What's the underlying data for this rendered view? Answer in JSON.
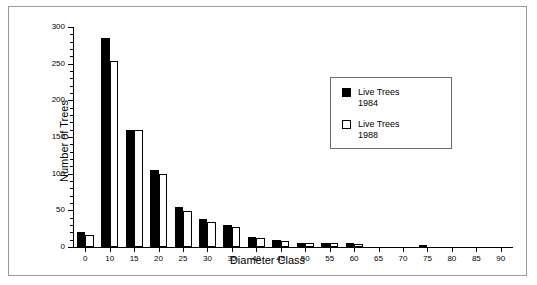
{
  "chart_data": {
    "type": "bar",
    "title": "",
    "xlabel": "Diameter Class",
    "ylabel": "Number of Trees",
    "ylim": [
      0,
      300
    ],
    "ytick_step": 50,
    "yticks": [
      0,
      50,
      100,
      150,
      200,
      250,
      300
    ],
    "ytick_labels": [
      "0",
      "50",
      "100",
      "150",
      "200",
      "250",
      "300"
    ],
    "grid": false,
    "legend_position": "upper-right",
    "categories": [
      0,
      10,
      15,
      20,
      25,
      30,
      35,
      40,
      45,
      50,
      55,
      60,
      65,
      70,
      75,
      80,
      85,
      90
    ],
    "category_labels": [
      "0",
      "10",
      "15",
      "20",
      "25",
      "30",
      "35",
      "40",
      "45",
      "50",
      "55",
      "60",
      "65",
      "70",
      "75",
      "80",
      "85",
      "90"
    ],
    "series": [
      {
        "name": "Live Trees 1984",
        "fill": "#000000",
        "values": [
          20,
          285,
          160,
          105,
          55,
          38,
          30,
          14,
          9,
          5,
          5,
          5,
          0,
          0,
          3,
          0,
          0,
          0
        ]
      },
      {
        "name": "Live Trees 1988",
        "fill": "#ffffff",
        "values": [
          17,
          253,
          159,
          100,
          49,
          34,
          27,
          12,
          8,
          5,
          5,
          4,
          0,
          0,
          0,
          0,
          0,
          0
        ]
      }
    ]
  },
  "legend": {
    "entries": [
      {
        "label_line1": "Live Trees",
        "label_line2": "1984",
        "swatch": "filled-black-square"
      },
      {
        "label_line1": "Live Trees",
        "label_line2": "1988",
        "swatch": "open-white-square"
      }
    ]
  },
  "colors": {
    "series_1984": "#000000",
    "series_1988": "#ffffff",
    "axis": "#000000",
    "frame_border": "#9a9a9a",
    "legend_border": "#6d6d6d"
  }
}
